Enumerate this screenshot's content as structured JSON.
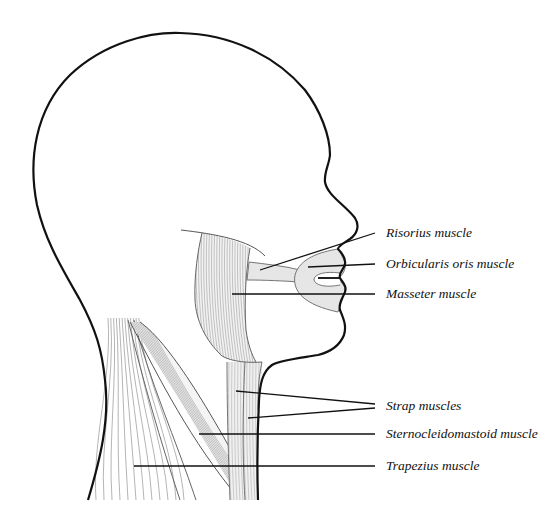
{
  "colors": {
    "outline": "#111111",
    "muscle_fill": "#e6e6e6",
    "striation": "#9a9a9a",
    "leader": "#111111"
  },
  "labels": [
    {
      "id": "risorius",
      "text": "Risorius muscle"
    },
    {
      "id": "orbicularis",
      "text": "Orbicularis oris muscle"
    },
    {
      "id": "masseter",
      "text": "Masseter muscle"
    },
    {
      "id": "strap",
      "text": "Strap muscles"
    },
    {
      "id": "sternocleidomastoid",
      "text": "Sternocleidomastoid muscle"
    },
    {
      "id": "trapezius",
      "text": "Trapezius muscle"
    }
  ]
}
